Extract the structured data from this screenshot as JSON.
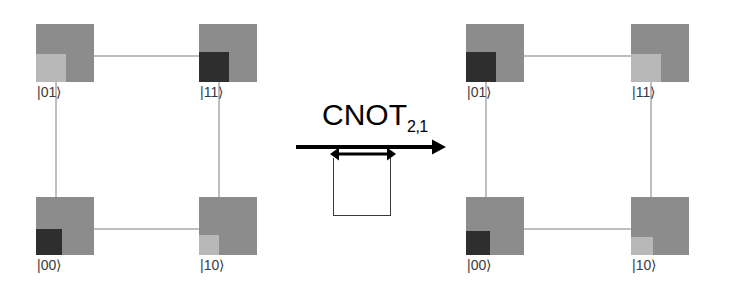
{
  "figure": {
    "type": "quantum-state-lattice-transformation"
  },
  "operator": {
    "name": "CNOT",
    "subscript": "2,1",
    "arrow_icon": "right-arrow-icon",
    "swap_arrow_icon": "double-headed-arrow-icon",
    "swap_box_icon": "open-square-icon"
  },
  "colors": {
    "tile": "#8c8c8c",
    "patch_dark": "#2e2e2e",
    "patch_light": "#b8b8b8",
    "edge": "#bfbfbf",
    "label": "#3a3a3a",
    "ink": "#000000",
    "background": "#ffffff"
  },
  "panels": [
    {
      "id": "before",
      "name": "initial-state-lattice",
      "vertices": [
        {
          "ket": "|01⟩",
          "position": "top-left",
          "patch": "light",
          "patch_width": 30,
          "patch_height": 28
        },
        {
          "ket": "|11⟩",
          "position": "top-right",
          "patch": "dark",
          "patch_width": 30,
          "patch_height": 30
        },
        {
          "ket": "|00⟩",
          "position": "bottom-left",
          "patch": "dark",
          "patch_width": 26,
          "patch_height": 26
        },
        {
          "ket": "|10⟩",
          "position": "bottom-right",
          "patch": "light",
          "patch_width": 20,
          "patch_height": 20
        }
      ]
    },
    {
      "id": "after",
      "name": "final-state-lattice",
      "vertices": [
        {
          "ket": "|01⟩",
          "position": "top-left",
          "patch": "dark",
          "patch_width": 30,
          "patch_height": 30
        },
        {
          "ket": "|11⟩",
          "position": "top-right",
          "patch": "light",
          "patch_width": 30,
          "patch_height": 28
        },
        {
          "ket": "|00⟩",
          "position": "bottom-left",
          "patch": "dark",
          "patch_width": 24,
          "patch_height": 24
        },
        {
          "ket": "|10⟩",
          "position": "bottom-right",
          "patch": "light",
          "patch_width": 22,
          "patch_height": 18
        }
      ]
    }
  ]
}
